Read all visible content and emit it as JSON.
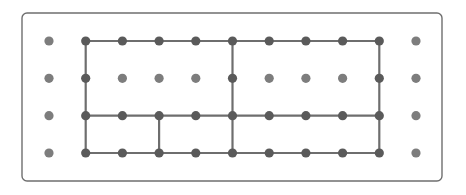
{
  "diagram": {
    "type": "dot-grid-partition",
    "frame": {
      "x": 22,
      "y": 13,
      "width": 420,
      "height": 168,
      "radius": 5,
      "stroke": "#6f6f6f"
    },
    "grid": {
      "columns_x": [
        49,
        85.7,
        122.4,
        159.1,
        195.8,
        232.5,
        269.2,
        305.9,
        342.6,
        379.3,
        416
      ],
      "rows_y": [
        41,
        78.3,
        115.7,
        153
      ],
      "dot_radius": 4.6,
      "dot_color": "#7d7d7d",
      "active_dot_color": "#5a5a5a"
    },
    "line_color": "#6e6e6e",
    "line_width": 2.2,
    "segments": [
      {
        "name": "outer-top",
        "from": [
          1,
          0
        ],
        "to": [
          9,
          0
        ]
      },
      {
        "name": "outer-bottom",
        "from": [
          1,
          3
        ],
        "to": [
          9,
          3
        ]
      },
      {
        "name": "outer-left",
        "from": [
          1,
          0
        ],
        "to": [
          1,
          3
        ]
      },
      {
        "name": "outer-right",
        "from": [
          9,
          0
        ],
        "to": [
          9,
          3
        ]
      },
      {
        "name": "middle-vertical",
        "from": [
          5,
          0
        ],
        "to": [
          5,
          3
        ]
      },
      {
        "name": "row2-horizontal",
        "from": [
          1,
          2
        ],
        "to": [
          9,
          2
        ]
      },
      {
        "name": "small-vertical",
        "from": [
          3,
          2
        ],
        "to": [
          3,
          3
        ]
      }
    ]
  }
}
